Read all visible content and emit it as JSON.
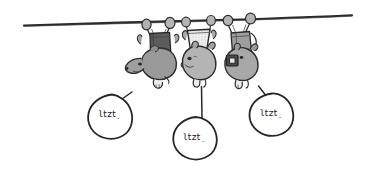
{
  "scene": {
    "title": "hand-drawn sketch of three upside-down possums hanging from a wire",
    "background_color": "#ffffff",
    "ink_color": "#262626",
    "width": 371,
    "height": 189
  },
  "wire": {
    "name": "power-line-wire",
    "color": "#2b2b2b"
  },
  "characters": [
    {
      "name": "possum-left",
      "body_color": "#9a9a9a",
      "pack_color": "#5c5c5c",
      "pack_label": "backpack"
    },
    {
      "name": "possum-middle",
      "body_color": "#b4b4b4",
      "pack_color": "#e8e8e8",
      "pack_label": "light-bag"
    },
    {
      "name": "possum-right",
      "body_color": "#a8a8a8",
      "pack_color": "#9e9e9e",
      "pack_label": "satchel-with-camera"
    }
  ],
  "speech_bubbles": [
    {
      "name": "speech-bubble-left",
      "text": "˙ʇzʇʅ",
      "fill": "#ffffff",
      "stroke": "#262626"
    },
    {
      "name": "speech-bubble-middle",
      "text": "˙ʇzʇʅ",
      "fill": "#ffffff",
      "stroke": "#262626"
    },
    {
      "name": "speech-bubble-right",
      "text": "˙ʇzʇʅ",
      "fill": "#ffffff",
      "stroke": "#262626"
    }
  ]
}
